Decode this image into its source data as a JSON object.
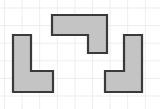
{
  "figure": {
    "width": 160,
    "height": 109,
    "background_color": "#ffffff",
    "grid": {
      "visible": true,
      "color": "#ededed",
      "line_width": 1,
      "spacing": 17.6,
      "x_lines": [
        4.5,
        22.1,
        39.7,
        57.3,
        74.9,
        92.5,
        110.1,
        127.7,
        145.3
      ],
      "y_lines": [
        8.0,
        25.6,
        43.2,
        60.8,
        78.4,
        96.0
      ]
    },
    "shape_style": {
      "fill_color": "#c4c4c4",
      "stroke_color": "#3a3a3a",
      "stroke_width": 2.2,
      "line_join": "miter"
    },
    "shapes": [
      {
        "name": "left-l-shape",
        "label": "L",
        "cells": 4,
        "points": "13,35 31,35 31,71 53,71 53,92 13,92"
      },
      {
        "name": "middle-j-shape",
        "label": "J-rotated",
        "cells": 4,
        "points": "52,15 107,15 107,53 88,53 88,35 52,35"
      },
      {
        "name": "right-j-shape",
        "label": "J",
        "cells": 4,
        "points": "124,35 142,35 142,92 105,92 105,71 124,71"
      }
    ]
  }
}
